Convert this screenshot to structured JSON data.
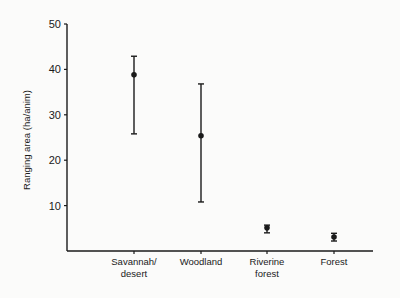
{
  "chart_data": {
    "type": "scatter",
    "subtype": "mean_with_error_bars",
    "title": "",
    "xlabel": "",
    "ylabel": "Ranging area (ha/anim)",
    "ylim": [
      0,
      50
    ],
    "yticks": [
      10,
      20,
      30,
      40,
      50
    ],
    "grid": false,
    "legend": null,
    "categories": [
      "Savannah/ desert",
      "Woodland",
      "Riverine forest",
      "Forest"
    ],
    "category_lines": [
      [
        "Savannah/",
        "desert"
      ],
      [
        "Woodland"
      ],
      [
        "Riverine",
        "forest"
      ],
      [
        "Forest"
      ]
    ],
    "series": [
      {
        "name": "Ranging area",
        "values": [
          38.8,
          25.4,
          5.1,
          3.1
        ],
        "error_upper": [
          42.9,
          36.8,
          5.7,
          3.9
        ],
        "error_lower": [
          25.8,
          10.8,
          4.0,
          2.2
        ]
      }
    ]
  },
  "colors": {
    "background": "#fbfbfa",
    "ink": "#1a1a1a"
  }
}
